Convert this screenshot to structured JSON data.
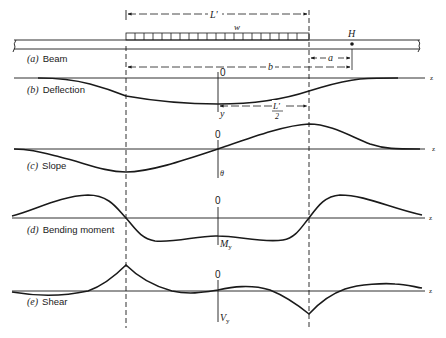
{
  "figure": {
    "panels": [
      {
        "id": "a",
        "prefix": "(a)",
        "label": "Beam"
      },
      {
        "id": "b",
        "prefix": "(b)",
        "label": "Deflection"
      },
      {
        "id": "c",
        "prefix": "(c)",
        "label": "Slope"
      },
      {
        "id": "d",
        "prefix": "(d)",
        "label": "Bending moment"
      },
      {
        "id": "e",
        "prefix": "(e)",
        "label": "Shear"
      }
    ],
    "beam": {
      "load_length_label": "L'",
      "load_label": "w",
      "point_label": "H",
      "dim_a_label": "a",
      "dim_b_label": "b"
    },
    "deflection": {
      "origin_label": "0",
      "axis_label": "y",
      "half_length_num": "L'",
      "half_length_den": "2",
      "x_axis_label": "z"
    },
    "slope": {
      "origin_label": "0",
      "axis_label": "θ",
      "x_axis_label": "z"
    },
    "moment": {
      "origin_label": "0",
      "axis_label": "M",
      "axis_sub": "y",
      "x_axis_label": "z"
    },
    "shear": {
      "origin_label": "0",
      "axis_label": "V",
      "axis_sub": "y",
      "x_axis_label": "z"
    },
    "colors": {
      "ink": "#1a1a1a",
      "background": "#ffffff"
    }
  }
}
